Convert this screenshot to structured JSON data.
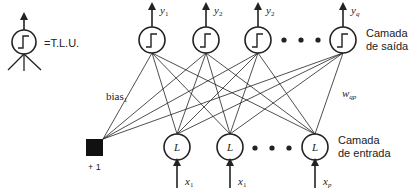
{
  "legend": {
    "symbol": "tlu-neuron-icon",
    "label": "=T.L.U."
  },
  "output_layer": {
    "label_line1": "Camada",
    "label_line2": "de saída",
    "neurons": [
      {
        "label": "y",
        "sub": "1"
      },
      {
        "label": "y",
        "sub": "2"
      },
      {
        "label": "y",
        "sub": "2"
      },
      {
        "label": "y",
        "sub": "q"
      }
    ],
    "ellipsis": "• • •"
  },
  "input_layer": {
    "label_line1": "Camada",
    "label_line2": "de entrada",
    "neuron_glyph": "L",
    "inputs": [
      {
        "label": "x",
        "sub": "1"
      },
      {
        "label": "x",
        "sub": "1"
      },
      {
        "label": "x",
        "sub": "p"
      }
    ],
    "ellipsis": "• • •"
  },
  "bias": {
    "label": "bias",
    "sub": "1",
    "unit_label": "+ 1"
  },
  "weight": {
    "label": "w",
    "sub": "qp"
  },
  "colors": {
    "stroke": "#222222",
    "bias_fill": "#111111",
    "background": "#ffffff"
  }
}
